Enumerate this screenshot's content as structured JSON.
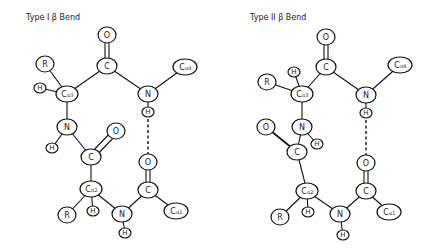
{
  "left": {
    "title": "Type I β Bend",
    "atoms": {
      "O_top": "O",
      "C_top": "C",
      "R_top": "R",
      "H_ca3": "H",
      "Ca3": "C",
      "Ca3_sub": "α3",
      "N_top": "N",
      "Ca4": "C",
      "Ca4_sub": "α4",
      "H_Ntop": "H",
      "N_mid": "N",
      "H_Nmid": "H",
      "O_mid": "O",
      "C_mid": "C",
      "Ca2": "C",
      "Ca2_sub": "α2",
      "R_bot": "R",
      "H_ca2": "H",
      "N_bot": "N",
      "H_Nbot": "H",
      "C_bot": "C",
      "O_bot": "O",
      "Ca1": "C",
      "Ca1_sub": "α1"
    }
  },
  "right": {
    "title": "Type II β Bend",
    "atoms": {
      "O_top": "O",
      "C_top": "C",
      "R_top": "R",
      "H_ca3": "H",
      "Ca3": "C",
      "Ca3_sub": "α3",
      "N_top": "N",
      "Ca4": "C",
      "Ca4_sub": "α4",
      "H_Ntop": "H",
      "N_mid": "N",
      "H_Nmid": "H",
      "O_mid": "O",
      "C_mid": "C",
      "Ca2": "C",
      "Ca2_sub": "α2",
      "R_bot": "R",
      "H_ca2": "H",
      "N_bot": "N",
      "H_Nbot": "H",
      "C_bot": "C",
      "O_bot": "O",
      "Ca1": "C",
      "Ca1_sub": "α1"
    }
  }
}
